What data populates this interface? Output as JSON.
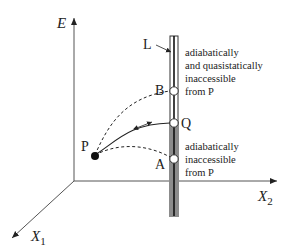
{
  "axes": {
    "vertical": "E",
    "horizontal": "X",
    "horizontal_sub": "2",
    "depth": "X",
    "depth_sub": "1"
  },
  "points": {
    "P": "P",
    "Q": "Q",
    "A": "A",
    "B": "B",
    "L": "L"
  },
  "annotations": {
    "upper": [
      "adiabatically",
      "and quasistatically",
      "inaccessible",
      "from P"
    ],
    "lower": [
      "adiabatically",
      "inaccessible",
      "from P"
    ]
  },
  "colors": {
    "line": "#222222",
    "axis": "#555555",
    "gray_band": "#8c8c8c"
  }
}
